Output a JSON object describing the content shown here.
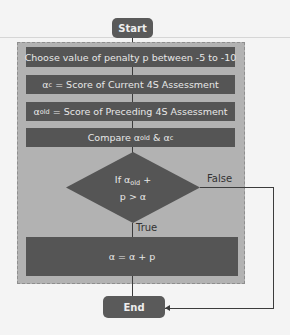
{
  "flowchart": {
    "start_label": "Start",
    "end_label": "End",
    "steps": [
      {
        "text": "Choose value of penalty p between -5 to -10"
      },
      {
        "symbol": "α",
        "sub": "c",
        "text": " = Score of Current 4S Assessment"
      },
      {
        "symbol": "α",
        "sub": "old",
        "text": " = Score of Preceding 4S Assessment"
      },
      {
        "prefix": "Compare ",
        "symbol": "α",
        "sub": "old",
        "mid": " & ",
        "symbol2": "α",
        "sub2": "c"
      }
    ],
    "decision": {
      "line1_prefix": "If ",
      "symbol": "α",
      "sub": "old",
      "line1_suffix": " +",
      "line2": "p > α"
    },
    "branch_true_label": "True",
    "branch_false_label": "False",
    "action": "α = α + p"
  },
  "colors": {
    "panel": "#b2b2b2",
    "box": "#555555",
    "terminal": "#5a5a5a",
    "text_light": "#e8e8e8"
  }
}
